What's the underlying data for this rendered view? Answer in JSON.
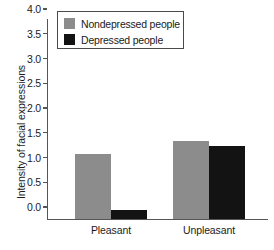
{
  "chart_data": {
    "type": "bar",
    "title": "",
    "xlabel": "",
    "ylabel": "Intensity of facial expressions",
    "categories": [
      "Pleasant",
      "Unpleasant"
    ],
    "series": [
      {
        "name": "Nondepressed people",
        "color": "#8c8c8c",
        "values": [
          1.32,
          1.57
        ]
      },
      {
        "name": "Depressed people",
        "color": "#131313",
        "values": [
          0.19,
          1.47
        ]
      }
    ],
    "ylim": [
      0.0,
      4.0
    ],
    "ytick_labels": [
      "0.0",
      "0.5",
      "1.0",
      "1.5",
      "2.0",
      "2.5",
      "3.0",
      "3.5",
      "4.0"
    ],
    "ytick_values": [
      0.0,
      0.5,
      1.0,
      1.5,
      2.0,
      2.5,
      3.0,
      3.5,
      4.0
    ],
    "grid": false,
    "legend_position": "top-left"
  }
}
